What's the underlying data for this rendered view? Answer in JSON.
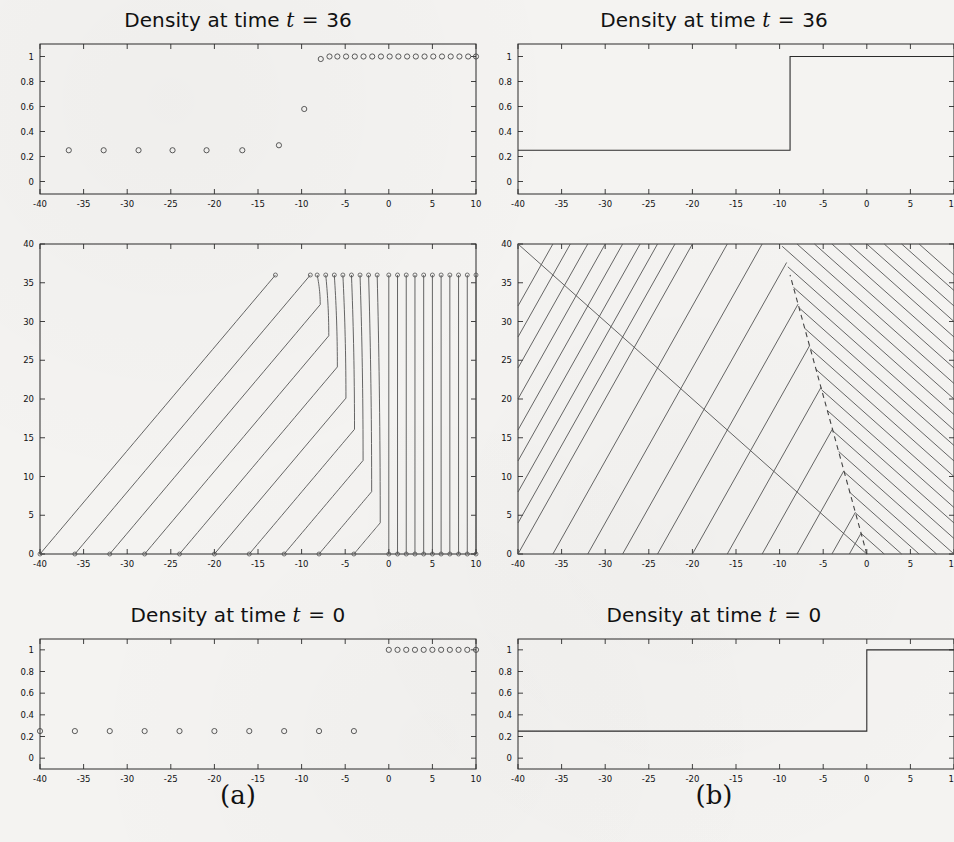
{
  "figure": {
    "captions": [
      {
        "id": "a",
        "label": "(a)"
      },
      {
        "id": "b",
        "label": "(b)"
      }
    ]
  },
  "panels": {
    "top_left": {
      "title_prefix": "Density at time ",
      "title_var": "t",
      "title_eq": "=",
      "title_value": "36"
    },
    "top_right": {
      "title_prefix": "Density at time ",
      "title_var": "t",
      "title_eq": "=",
      "title_value": "36"
    },
    "bottom_left": {
      "title_prefix": "Density at time ",
      "title_var": "t",
      "title_eq": "=",
      "title_value": "0"
    },
    "bottom_right": {
      "title_prefix": "Density at time ",
      "title_var": "t",
      "title_eq": "=",
      "title_value": "0"
    }
  },
  "axes": {
    "x_ticks": [
      "-40",
      "-35",
      "-30",
      "-25",
      "-20",
      "-15",
      "-10",
      "-5",
      "0",
      "5",
      "10"
    ],
    "x_tick_values": [
      -40,
      -35,
      -30,
      -25,
      -20,
      -15,
      -10,
      -5,
      0,
      5,
      10
    ],
    "density_y_ticks": [
      "0",
      "0.2",
      "0.4",
      "0.6",
      "0.8",
      "1"
    ],
    "density_y_tick_values": [
      0,
      0.2,
      0.4,
      0.6,
      0.8,
      1
    ],
    "time_y_ticks": [
      "0",
      "5",
      "10",
      "15",
      "20",
      "25",
      "30",
      "35",
      "40"
    ],
    "time_y_tick_values": [
      0,
      5,
      10,
      15,
      20,
      25,
      30,
      35,
      40
    ],
    "xlim": [
      -40,
      10
    ],
    "density_ylim": [
      -0.1,
      1.1
    ],
    "time_ylim": [
      0,
      40
    ]
  },
  "chart_data": [
    {
      "id": "density-t36-particle",
      "type": "scatter",
      "title": "Density at time t = 36",
      "xlabel": "",
      "ylabel": "",
      "xlim": [
        -40,
        10
      ],
      "ylim": [
        -0.1,
        1.1
      ],
      "grid": false,
      "legend": null,
      "marker": "open-circle",
      "x": [
        -36.7,
        -32.7,
        -28.7,
        -24.8,
        -20.9,
        -16.8,
        -12.6,
        -9.7,
        -7.8,
        -6.8,
        -5.9,
        -4.9,
        -3.9,
        -2.9,
        -1.9,
        -0.9,
        0.1,
        1.1,
        2.1,
        3.1,
        4.1,
        5.1,
        6.1,
        7.1,
        8.1,
        9.1,
        10.0
      ],
      "y": [
        0.25,
        0.25,
        0.25,
        0.25,
        0.25,
        0.25,
        0.29,
        0.58,
        0.98,
        1.0,
        1.0,
        1.0,
        1.0,
        1.0,
        1.0,
        1.0,
        1.0,
        1.0,
        1.0,
        1.0,
        1.0,
        1.0,
        1.0,
        1.0,
        1.0,
        1.0,
        1.0
      ]
    },
    {
      "id": "density-t36-continuum",
      "type": "line",
      "title": "Density at time t = 36",
      "xlabel": "",
      "ylabel": "",
      "xlim": [
        -40,
        10
      ],
      "ylim": [
        -0.1,
        1.1
      ],
      "grid": false,
      "legend": null,
      "x": [
        -40,
        -8.8,
        -8.8,
        10
      ],
      "y": [
        0.25,
        0.25,
        1.0,
        1.0
      ],
      "shock_position": -8.8,
      "left_density": 0.25,
      "right_density": 1.0
    },
    {
      "id": "vehicle-trajectories",
      "type": "line",
      "title": "",
      "xlabel": "",
      "ylabel": "",
      "xlim": [
        -40,
        10
      ],
      "ylim": [
        0,
        40
      ],
      "grid": false,
      "legend": null,
      "description": "Vehicle trajectories in x-t plane; free-flow vehicles start at x<0 spaced 4 apart and travel right at speed 0.75 until they hit the queue and stop; vehicles at x>=0 spaced 1 apart are stationary.",
      "free_start_x": [
        -40,
        -36,
        -32,
        -28,
        -24,
        -20,
        -16,
        -12,
        -8,
        -4
      ],
      "free_speed": 0.75,
      "queued_start_x": [
        0,
        1,
        2,
        3,
        4,
        5,
        6,
        7,
        8,
        9,
        10
      ],
      "final_time": 36,
      "marker_times": [
        0,
        36
      ],
      "marker": "open-circle"
    },
    {
      "id": "characteristics",
      "type": "line",
      "title": "",
      "xlabel": "",
      "ylabel": "",
      "xlim": [
        -40,
        10
      ],
      "ylim": [
        0,
        40
      ],
      "grid": false,
      "legend": null,
      "description": "Characteristics of the LWR traffic model with a shock. Left-state characteristics have slope dx/dt = 0.5; right-state characteristics have slope dx/dt = -1.0. They terminate on the dashed shock curve.",
      "left_characteristic_speed": 0.5,
      "right_characteristic_speed": -1.0,
      "left_start_x": [
        -40,
        -36,
        -32,
        -28,
        -24,
        -20,
        -16,
        -12,
        -8,
        -4,
        -2
      ],
      "right_start_x": [
        0,
        2,
        4,
        6,
        8,
        10
      ],
      "shock": {
        "style": "dashed",
        "x": [
          0,
          -8.8
        ],
        "t": [
          0,
          36
        ],
        "speed": -0.2444
      }
    },
    {
      "id": "density-t0-particle",
      "type": "scatter",
      "title": "Density at time t = 0",
      "xlabel": "",
      "ylabel": "",
      "xlim": [
        -40,
        10
      ],
      "ylim": [
        -0.1,
        1.1
      ],
      "grid": false,
      "legend": null,
      "marker": "open-circle",
      "x": [
        -40,
        -36,
        -32,
        -28,
        -24,
        -20,
        -16,
        -12,
        -8,
        -4,
        0,
        1,
        2,
        3,
        4,
        5,
        6,
        7,
        8,
        9,
        10
      ],
      "y": [
        0.25,
        0.25,
        0.25,
        0.25,
        0.25,
        0.25,
        0.25,
        0.25,
        0.25,
        0.25,
        1.0,
        1.0,
        1.0,
        1.0,
        1.0,
        1.0,
        1.0,
        1.0,
        1.0,
        1.0,
        1.0
      ]
    },
    {
      "id": "density-t0-continuum",
      "type": "line",
      "title": "Density at time t = 0",
      "xlabel": "",
      "ylabel": "",
      "xlim": [
        -40,
        10
      ],
      "ylim": [
        -0.1,
        1.1
      ],
      "grid": false,
      "legend": null,
      "x": [
        -40,
        0,
        0,
        10
      ],
      "y": [
        0.25,
        0.25,
        1.0,
        1.0
      ],
      "shock_position": 0,
      "left_density": 0.25,
      "right_density": 1.0
    }
  ],
  "colors": {
    "background": "#f4f3f1",
    "axis": "#2b2b2b",
    "curve": "#2b2b2b",
    "characteristic": "#555555",
    "marker": "#4a4a4a",
    "text": "#111111"
  }
}
